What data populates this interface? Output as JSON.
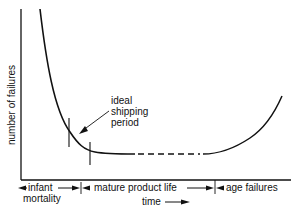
{
  "diagram": {
    "y_axis_label": "number of failures",
    "x_axis_label": "time",
    "annotation": {
      "line1": "ideal",
      "line2": "shipping",
      "line3": "period"
    },
    "regions": [
      {
        "line1": "infant",
        "line2": "mortality"
      },
      {
        "line1": "mature product life"
      },
      {
        "line1": "age failures"
      }
    ],
    "colors": {
      "line": "#111111",
      "background": "#ffffff"
    }
  }
}
